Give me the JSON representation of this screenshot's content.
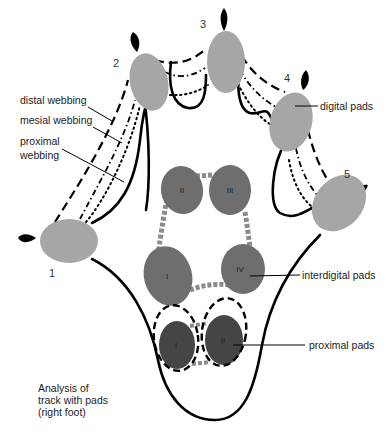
{
  "diagram": {
    "caption_lines": [
      "Analysis of",
      "track with pads",
      "(right foot)"
    ],
    "labels": {
      "distal_webbing": "distal webbing",
      "mesial_webbing": "mesial webbing",
      "proximal_webbing_1": "proximal",
      "proximal_webbing_2": "webbing",
      "digital_pads": "digital pads",
      "interdigital_pads": "interdigital pads",
      "proximal_pads": "proximal pads"
    },
    "digit_numbers": [
      "1",
      "2",
      "3",
      "4",
      "5"
    ],
    "interdigital_numerals": [
      "I",
      "II",
      "III",
      "IV"
    ],
    "proximal_numerals": [
      "I",
      "II"
    ],
    "colors": {
      "digital_pad": "#a6a6a6",
      "interdigital_pad": "#6e6e6e",
      "proximal_pad": "#454545",
      "outline": "#000000",
      "claw": "#000000",
      "background": "#ffffff"
    }
  }
}
